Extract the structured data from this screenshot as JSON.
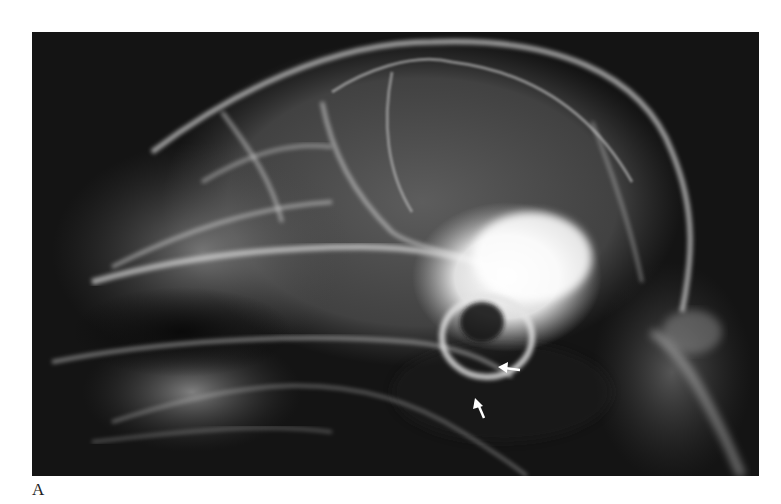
{
  "figure": {
    "panel_label": "A",
    "image": {
      "type": "lateral skull radiograph",
      "background_color": "#141414",
      "bone_color": "#e8e8e8"
    },
    "annotations": [
      {
        "name": "arrow-1",
        "direction": "left",
        "color": "#ffffff"
      },
      {
        "name": "arrow-2",
        "direction": "up",
        "color": "#ffffff"
      }
    ]
  }
}
